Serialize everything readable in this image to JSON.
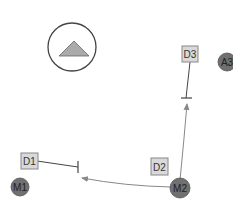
{
  "diagram": {
    "colors": {
      "background": "#ffffff",
      "stroke": "#444444",
      "box_fill": "#d9d9d9",
      "box_stroke": "#888888",
      "node_fill": "#707070",
      "triangle_fill": "#aaaaaa",
      "edge": "#888888"
    },
    "compartment": {
      "icon": "triangle-up-icon"
    },
    "boxes": [
      {
        "id": "D1",
        "label": "D1"
      },
      {
        "id": "D2",
        "label": "D2"
      },
      {
        "id": "D3",
        "label": "D3"
      }
    ],
    "nodes": [
      {
        "id": "M1",
        "label": "M1"
      },
      {
        "id": "M2",
        "label": "M2"
      },
      {
        "id": "A3",
        "label": "A3"
      }
    ],
    "edges": [
      {
        "from": "D1",
        "type": "inhibition"
      },
      {
        "from": "D3",
        "type": "inhibition"
      },
      {
        "from": "M2",
        "to": "D1-target",
        "type": "arrow"
      },
      {
        "from": "M2",
        "to": "D3-target",
        "type": "arrow"
      }
    ]
  }
}
